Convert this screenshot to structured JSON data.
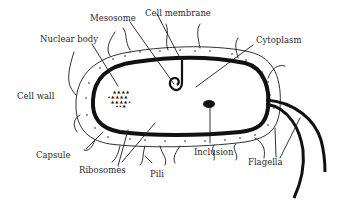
{
  "diagram": {
    "labels": [
      {
        "id": "mesosome",
        "text": "Mesosome"
      },
      {
        "id": "cell-membrane",
        "text": "Cell membrane"
      },
      {
        "id": "nuclear-body",
        "text": "Nuclear body"
      },
      {
        "id": "cytoplasm",
        "text": "Cytoplasm"
      },
      {
        "id": "cell-wall",
        "text": "Cell wall"
      },
      {
        "id": "capsule",
        "text": "Capsule"
      },
      {
        "id": "ribosomes",
        "text": "Ribosomes"
      },
      {
        "id": "pili",
        "text": "Pili"
      },
      {
        "id": "inclusion",
        "text": "Inclusion"
      },
      {
        "id": "flagella",
        "text": "Flagella"
      }
    ],
    "colors": {
      "ink": "#1a1a1a",
      "background": "#ffffff"
    }
  }
}
